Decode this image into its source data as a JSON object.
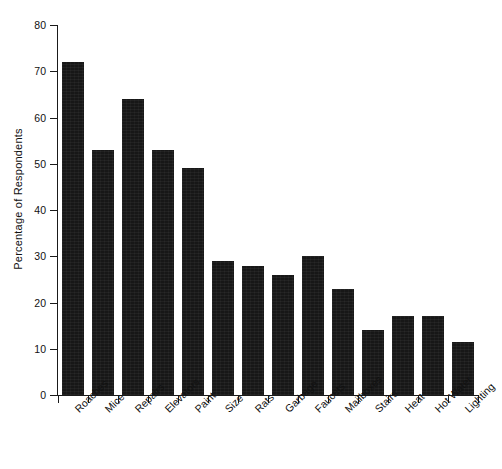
{
  "chart_data": {
    "type": "bar",
    "title": "",
    "xlabel": "",
    "ylabel": "Percentage of Respondents",
    "categories": [
      "Roaches",
      "Mice",
      "Repairs",
      "Elevators",
      "Paint",
      "Size",
      "Rats",
      "Garbage",
      "Faucets",
      "Mailboxes",
      "Stairs",
      "Heat",
      "Hot Water",
      "Lighting"
    ],
    "values": [
      72,
      53,
      64,
      53,
      49,
      29,
      28,
      26,
      30,
      23,
      14,
      17,
      17,
      11.5
    ],
    "ylim": [
      0,
      80
    ],
    "ytick_values": [
      0,
      10,
      20,
      30,
      40,
      50,
      60,
      70,
      80
    ],
    "ytick_labels": [
      "0",
      "10",
      "20",
      "30",
      "40",
      "50",
      "60",
      "70",
      "80"
    ],
    "grid": false,
    "legend": null,
    "bar_color": "#171717",
    "axis_color": "#1a1a1a",
    "background_color": "#ffffff"
  }
}
